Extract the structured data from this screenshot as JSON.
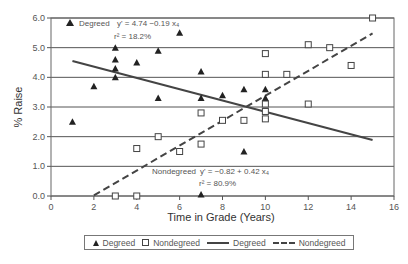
{
  "chart_data": {
    "type": "scatter",
    "title": "",
    "xlabel": "Time in Grade (Years)",
    "ylabel": "% Raise",
    "xlim": [
      0,
      16
    ],
    "ylim": [
      0,
      6
    ],
    "x_ticks": [
      "0",
      "2",
      "4",
      "6",
      "8",
      "10",
      "12",
      "14",
      "16"
    ],
    "y_ticks": [
      "0.0",
      "1.0",
      "2.0",
      "3.0",
      "4.0",
      "5.0",
      "6.0"
    ],
    "grid": "horizontal",
    "legend_position": "bottom",
    "series": [
      {
        "name": "Degreed",
        "marker": "triangle",
        "points": [
          [
            1,
            2.5
          ],
          [
            2,
            3.7
          ],
          [
            3,
            5.0
          ],
          [
            3,
            4.6
          ],
          [
            3,
            4.3
          ],
          [
            3,
            4.0
          ],
          [
            4,
            4.5
          ],
          [
            5,
            4.9
          ],
          [
            5,
            3.3
          ],
          [
            6,
            5.5
          ],
          [
            7,
            4.2
          ],
          [
            7,
            3.3
          ],
          [
            7,
            0.05
          ],
          [
            8,
            3.4
          ],
          [
            9,
            3.6
          ],
          [
            9,
            1.5
          ],
          [
            10,
            3.6
          ],
          [
            10,
            3.3
          ]
        ]
      },
      {
        "name": "Nondegreed",
        "marker": "square",
        "points": [
          [
            3,
            0.0
          ],
          [
            4,
            0.0
          ],
          [
            4,
            1.6
          ],
          [
            5,
            2.0
          ],
          [
            6,
            1.5
          ],
          [
            7,
            1.75
          ],
          [
            7,
            2.8
          ],
          [
            8,
            2.55
          ],
          [
            9,
            2.55
          ],
          [
            10,
            2.6
          ],
          [
            10,
            2.85
          ],
          [
            10,
            3.1
          ],
          [
            10,
            4.1
          ],
          [
            10,
            4.8
          ],
          [
            11,
            4.1
          ],
          [
            12,
            3.1
          ],
          [
            12,
            5.1
          ],
          [
            13,
            5.0
          ],
          [
            14,
            4.4
          ],
          [
            15,
            6.0
          ]
        ]
      }
    ],
    "trendlines": [
      {
        "name": "Degreed",
        "style": "solid",
        "intercept": 4.74,
        "slope": -0.19,
        "x_range": [
          1,
          15
        ],
        "equation": "y' = 4.74 −0.19 x₄",
        "r2": "r² = 18.2%"
      },
      {
        "name": "Nondegreed",
        "style": "dashed",
        "intercept": -0.82,
        "slope": 0.42,
        "x_range": [
          2,
          15
        ],
        "equation": "y' = −0.82 + 0.42 x₄",
        "r2": "r² = 80.9%"
      }
    ],
    "annotations": {
      "degreed_label": "Degreed",
      "degreed_eq": "y' = 4.74 −0.19 x₄",
      "degreed_r2": "r² = 18.2%",
      "nondegreed_label": "Nondegreed",
      "nondegreed_eq": "y' = −0.82 + 0.42 x₄",
      "nondegreed_r2": "r² = 80.9%"
    },
    "legend": [
      "Degreed",
      "Nondegreed",
      "Degreed",
      "Nondegreed"
    ]
  }
}
